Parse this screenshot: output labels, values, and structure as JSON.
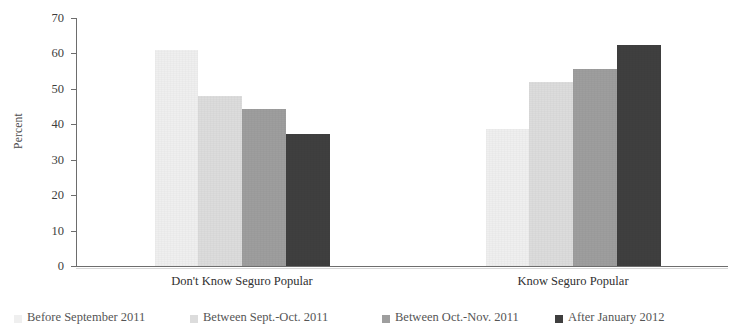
{
  "chart_data": {
    "type": "bar",
    "title": "",
    "xlabel": "",
    "ylabel": "Percent",
    "ylim": [
      0,
      70
    ],
    "ytick_step": 10,
    "yticks": [
      70,
      60,
      50,
      40,
      30,
      20,
      10,
      0
    ],
    "grid": false,
    "legend_position": "bottom",
    "categories": [
      "Don't Know Seguro Popular",
      "Know Seguro Popular"
    ],
    "series": [
      {
        "name": "Before September 2011",
        "color": "#efefef",
        "values": [
          61.0,
          38.8
        ]
      },
      {
        "name": "Between Sept.-Oct. 2011",
        "color": "#dcdcdc",
        "values": [
          48.0,
          52.0
        ]
      },
      {
        "name": "Between Oct.-Nov. 2011",
        "color": "#9e9e9e",
        "values": [
          44.3,
          55.7
        ]
      },
      {
        "name": "After January 2012",
        "color": "#3f3f3f",
        "values": [
          37.4,
          62.4
        ]
      }
    ]
  },
  "axis": {
    "y_title": "Percent"
  }
}
